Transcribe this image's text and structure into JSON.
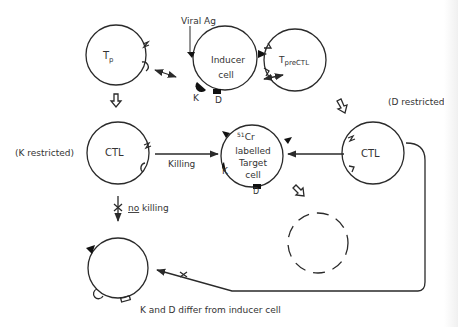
{
  "diagram": {
    "type": "cell-interaction-diagram",
    "colors": {
      "line": "#2a2a2a",
      "text": "#333333",
      "background": "#ffffff"
    },
    "cells": {
      "tp": {
        "label_main": "T",
        "label_sub": "p"
      },
      "inducer": {
        "line1": "Inducer",
        "line2": "cell",
        "marker_k": "K",
        "marker_d": "D"
      },
      "tprectl": {
        "label_main": "T",
        "label_sub": "preCTL"
      },
      "ctl_left": {
        "label": "CTL"
      },
      "target": {
        "sup": "51",
        "main": "Cr",
        "line2": "labelled",
        "line3": "Target",
        "line4": "cell",
        "marker_k": "K",
        "marker_d": "D"
      },
      "ctl_right": {
        "label": "CTL"
      },
      "lysed": {
        "label": ""
      },
      "bottom": {
        "label": ""
      }
    },
    "labels": {
      "viral_ag": "Viral Ag",
      "k_restricted": "(K restricted)",
      "d_restricted": "(D restricted)",
      "killing": "Killing",
      "no": "no",
      "no_killing_rest": " killing",
      "k_and_d_differ": "K and D differ from inducer cell"
    },
    "edges": [
      {
        "from": "tp",
        "to": "inducer",
        "type": "bidirectional"
      },
      {
        "from": "inducer",
        "to": "tprectl",
        "type": "bidirectional"
      },
      {
        "from": "tp",
        "to": "ctl_left",
        "type": "differentiation"
      },
      {
        "from": "tprectl",
        "to": "ctl_right",
        "type": "differentiation"
      },
      {
        "from": "ctl_left",
        "to": "target",
        "type": "killing",
        "label": "Killing"
      },
      {
        "from": "ctl_right",
        "to": "target",
        "type": "killing"
      },
      {
        "from": "target",
        "to": "lysed",
        "type": "lysis"
      },
      {
        "from": "ctl_left",
        "to": "bottom",
        "type": "blocked",
        "label": "no killing"
      },
      {
        "from": "ctl_right",
        "to": "bottom",
        "type": "blocked"
      }
    ]
  }
}
